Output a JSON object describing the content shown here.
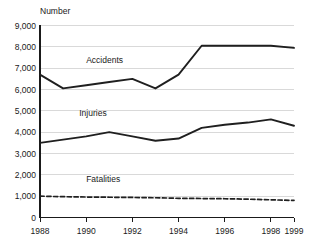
{
  "chart_data": {
    "type": "line",
    "title": "",
    "ylabel": "Number",
    "xlabel": "",
    "x": [
      1988,
      1989,
      1990,
      1991,
      1992,
      1993,
      1994,
      1995,
      1996,
      1997,
      1998,
      1999
    ],
    "xlim": [
      1988,
      1999
    ],
    "ylim": [
      0,
      9000
    ],
    "yticks": [
      0,
      1000,
      2000,
      3000,
      4000,
      5000,
      6000,
      7000,
      8000,
      9000
    ],
    "ytick_labels": [
      "0",
      "1,000",
      "2,000",
      "3,000",
      "4,000",
      "5,000",
      "6,000",
      "7,000",
      "8,000",
      "9,000"
    ],
    "xticks": [
      1988,
      1990,
      1992,
      1994,
      1996,
      1998,
      1999
    ],
    "xtick_labels": [
      "1988",
      "1990",
      "1992",
      "1994",
      "1996",
      "1998",
      "1999"
    ],
    "grid": true,
    "grid_axis": "y",
    "legend": "inline-labels",
    "series": [
      {
        "name": "Accidents",
        "style": "solid",
        "color": "#1f1f1f",
        "label_x": 1990.0,
        "label_y": 7250,
        "values": [
          6700,
          6050,
          6200,
          6350,
          6500,
          6050,
          6700,
          8050,
          8050,
          8050,
          8050,
          7950
        ]
      },
      {
        "name": "Injuries",
        "style": "solid",
        "color": "#1f1f1f",
        "label_x": 1989.7,
        "label_y": 4750,
        "values": [
          3500,
          3650,
          3800,
          4000,
          3800,
          3600,
          3700,
          4200,
          4350,
          4450,
          4600,
          4300
        ]
      },
      {
        "name": "Fatalities",
        "style": "dashed",
        "color": "#1f1f1f",
        "label_x": 1990.0,
        "label_y": 1650,
        "values": [
          1000,
          975,
          960,
          950,
          940,
          925,
          900,
          890,
          880,
          860,
          830,
          800
        ]
      }
    ]
  }
}
